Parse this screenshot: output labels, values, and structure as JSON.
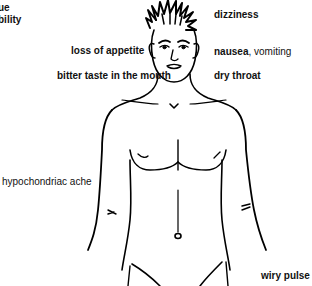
{
  "diagram": {
    "type": "symptom-body-map",
    "figure": "male torso line drawing",
    "labels": {
      "top_left_line1": "ue",
      "top_left_line2": "bility",
      "dizziness": "dizziness",
      "loss_of_appetite": "loss of appetite",
      "nausea": "nausea",
      "vomiting": ", vomiting",
      "bitter_taste": "bitter taste in the mouth",
      "dry_throat": "dry throat",
      "hypochondriac_ache": "hypochondriac ache",
      "wiry_pulse": "wiry pulse"
    },
    "colors": {
      "ink": "#000000",
      "text": "#111111",
      "background": "#ffffff"
    }
  }
}
